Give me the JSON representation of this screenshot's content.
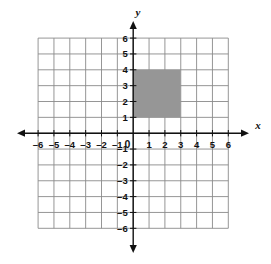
{
  "figure": {
    "type": "coordinate-grid",
    "background_color": "#ffffff",
    "width": 271,
    "height": 264
  },
  "axes": {
    "x_label": "x",
    "y_label": "y",
    "axis_color": "#111111",
    "grid_color": "#8a8a8a",
    "x_range": [
      -6,
      6
    ],
    "y_range": [
      -6,
      6
    ],
    "x_tick_labels": [
      "–6",
      "–5",
      "–4",
      "–3",
      "–2",
      "–1",
      "1",
      "2",
      "3",
      "4",
      "5",
      "6"
    ],
    "y_tick_labels": [
      "6",
      "5",
      "4",
      "3",
      "2",
      "1",
      "–1",
      "–2",
      "–3",
      "–4",
      "–5",
      "–6"
    ],
    "origin_label": "0",
    "arrowheads": [
      "left",
      "right",
      "up",
      "down"
    ]
  },
  "chart_data": {
    "type": "scatter",
    "title": "",
    "xlabel": "x",
    "ylabel": "y",
    "xlim": [
      -6,
      6
    ],
    "ylim": [
      -6,
      6
    ],
    "grid": true,
    "legend": null,
    "x_ticks": [
      -6,
      -5,
      -4,
      -3,
      -2,
      -1,
      0,
      1,
      2,
      3,
      4,
      5,
      6
    ],
    "y_ticks": [
      -6,
      -5,
      -4,
      -3,
      -2,
      -1,
      0,
      1,
      2,
      3,
      4,
      5,
      6
    ],
    "shapes": [
      {
        "name": "shaded-square",
        "kind": "rectangle",
        "x_min": 0,
        "x_max": 3,
        "y_min": 1,
        "y_max": 4,
        "width_units": 3,
        "height_units": 3,
        "area_units": 9,
        "vertices": [
          [
            0,
            1
          ],
          [
            3,
            1
          ],
          [
            3,
            4
          ],
          [
            0,
            4
          ]
        ],
        "fill": "#969696",
        "stroke": "none"
      }
    ]
  }
}
